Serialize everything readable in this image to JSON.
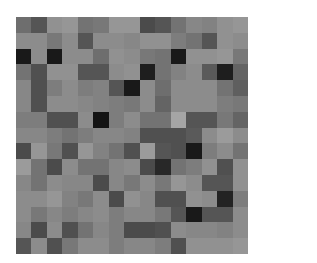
{
  "image": {
    "description": "15x15 grid of grayscale pixel blocks",
    "background": "#ffffff"
  },
  "chart_data": {
    "type": "heatmap",
    "title": "",
    "xlabel": "",
    "ylabel": "",
    "rows": 15,
    "cols": 15,
    "colormap": "gray",
    "values": [
      [
        110,
        85,
        145,
        150,
        115,
        120,
        150,
        150,
        75,
        85,
        115,
        135,
        130,
        145,
        150
      ],
      [
        140,
        140,
        120,
        140,
        85,
        140,
        140,
        135,
        145,
        145,
        125,
        115,
        85,
        145,
        140
      ],
      [
        25,
        140,
        25,
        140,
        140,
        110,
        145,
        140,
        120,
        115,
        25,
        145,
        145,
        150,
        120
      ],
      [
        115,
        80,
        145,
        145,
        85,
        85,
        140,
        145,
        30,
        115,
        130,
        140,
        90,
        30,
        100
      ],
      [
        135,
        80,
        125,
        140,
        125,
        130,
        85,
        25,
        140,
        110,
        140,
        140,
        140,
        115,
        95
      ],
      [
        135,
        80,
        140,
        140,
        135,
        130,
        125,
        120,
        140,
        100,
        140,
        140,
        140,
        125,
        120
      ],
      [
        125,
        125,
        80,
        80,
        140,
        20,
        125,
        140,
        115,
        115,
        165,
        85,
        85,
        120,
        100
      ],
      [
        135,
        135,
        125,
        115,
        125,
        135,
        135,
        130,
        80,
        80,
        80,
        90,
        140,
        155,
        140
      ],
      [
        75,
        150,
        120,
        80,
        150,
        130,
        115,
        80,
        155,
        85,
        80,
        25,
        125,
        140,
        115
      ],
      [
        155,
        115,
        75,
        140,
        115,
        115,
        135,
        140,
        75,
        40,
        115,
        125,
        145,
        80,
        145
      ],
      [
        135,
        115,
        140,
        135,
        135,
        75,
        135,
        120,
        140,
        120,
        150,
        140,
        85,
        85,
        145
      ],
      [
        140,
        140,
        150,
        130,
        120,
        140,
        75,
        145,
        135,
        80,
        80,
        145,
        140,
        35,
        125
      ],
      [
        140,
        120,
        135,
        125,
        135,
        140,
        125,
        135,
        135,
        120,
        85,
        25,
        85,
        85,
        140
      ],
      [
        135,
        75,
        140,
        80,
        115,
        135,
        125,
        75,
        75,
        80,
        140,
        135,
        135,
        130,
        140
      ],
      [
        85,
        140,
        80,
        120,
        140,
        140,
        125,
        135,
        135,
        125,
        80,
        145,
        145,
        145,
        150
      ]
    ]
  }
}
